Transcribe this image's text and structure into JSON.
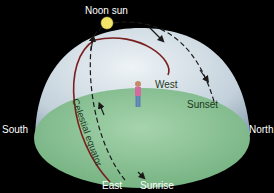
{
  "labels": {
    "noon_sun": "Noon sun",
    "west": "West",
    "sunset": "Sunset",
    "south": "South",
    "north": "North",
    "east": "East",
    "sunrise": "Sunrise",
    "celestial_equator": "Celestial equator"
  },
  "colors": {
    "background": "#000000",
    "dome": "#c9d6df",
    "ground": "#8fc79a",
    "celestial_equator": "#7a1f1f",
    "sun": "#f3e56a",
    "path": "#1a1a1a"
  }
}
